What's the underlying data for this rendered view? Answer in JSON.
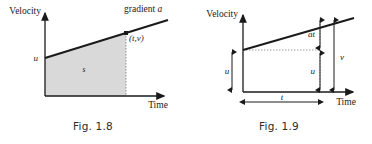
{
  "sheet": {
    "title": "Velocity-time graph figures",
    "background_color": "#ffffff",
    "ink_color": "#1a1a1a",
    "shade_color": "#d9d9d9",
    "dotted_color": "#9a9a9a"
  },
  "figures": [
    {
      "id": "fig-1-8",
      "caption": "Fig. 1.8",
      "y_axis_label": "Velocity",
      "x_axis_label": "Time",
      "gradient_label": "gradient a",
      "intercept_label": "u",
      "area_label": "s",
      "point_label": "(t,v)",
      "chart_data": {
        "type": "line",
        "title": "Fig. 1.8",
        "xlabel": "Time",
        "ylabel": "Velocity",
        "x": [
          0,
          1
        ],
        "y": [
          1,
          2
        ],
        "annotations": [
          {
            "text": "gradient a",
            "at": "line-end"
          },
          {
            "text": "u",
            "at": "y-intercept"
          },
          {
            "text": "s",
            "at": "shaded-area-under-line"
          },
          {
            "text": "(t,v)",
            "at": "point-on-line"
          }
        ],
        "grid": false,
        "legend": "none",
        "shaded_area": true
      }
    },
    {
      "id": "fig-1-9",
      "caption": "Fig. 1.9",
      "y_axis_label": "Velocity",
      "x_axis_label": "Time",
      "dim_u_left_label": "u",
      "dim_at_label": "at",
      "dim_u_inner_label": "u",
      "dim_v_label": "v",
      "dim_t_label": "t",
      "chart_data": {
        "type": "line",
        "title": "Fig. 1.9",
        "xlabel": "Time",
        "ylabel": "Velocity",
        "x": [
          0,
          1
        ],
        "y": [
          1,
          2
        ],
        "annotations": [
          {
            "text": "u",
            "at": "left-of-y-axis-dimension"
          },
          {
            "text": "at",
            "at": "upper-inner-dimension"
          },
          {
            "text": "u",
            "at": "lower-inner-dimension"
          },
          {
            "text": "v",
            "at": "outer-dimension-full-height"
          },
          {
            "text": "t",
            "at": "horizontal-dimension"
          }
        ],
        "grid": false,
        "legend": "none",
        "shaded_area": false
      }
    }
  ]
}
